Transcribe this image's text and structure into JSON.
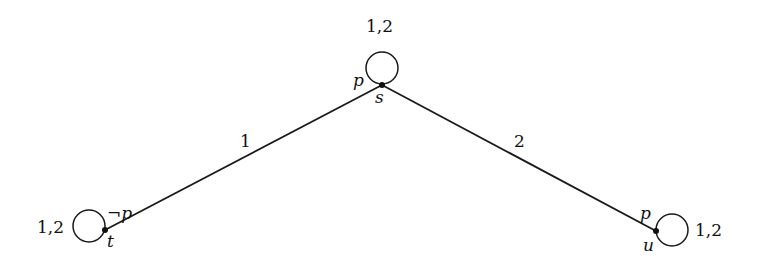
{
  "diagram": {
    "type": "kripke-model",
    "nodes": [
      {
        "id": "s",
        "name": "s",
        "prop": "p",
        "x": 382,
        "y": 58,
        "loop_label": "1,2"
      },
      {
        "id": "t",
        "name": "t",
        "prop": "¬p",
        "x": 105,
        "y": 230,
        "loop_label": "1,2"
      },
      {
        "id": "u",
        "name": "u",
        "prop": "p",
        "x": 656,
        "y": 231,
        "loop_label": "1,2"
      }
    ],
    "edges": [
      {
        "from": "t",
        "to": "s",
        "label": "1"
      },
      {
        "from": "s",
        "to": "u",
        "label": "2"
      }
    ],
    "colors": {
      "stroke": "#1a1a1a",
      "background": "#ffffff"
    }
  }
}
